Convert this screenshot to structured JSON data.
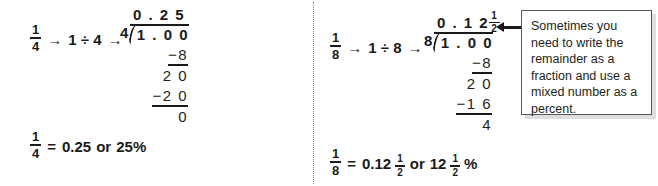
{
  "page": {
    "background": "#ffffff",
    "ink": "#1a1a1a"
  },
  "left_example": {
    "name": "one-fourth-example",
    "lead": {
      "fraction": {
        "numerator": "1",
        "denominator": "4"
      },
      "arrow1": "→",
      "expression": "1 ÷ 4",
      "arrow2": "→"
    },
    "division": {
      "quotient": "0 . 2 5",
      "divisor": "4",
      "dividend": "1 . 0 0",
      "steps": [
        {
          "text": "−8",
          "ruled": true
        },
        {
          "text": "2 0",
          "ruled": false
        },
        {
          "text": "−2 0",
          "ruled": true
        },
        {
          "text": "0",
          "ruled": false
        }
      ]
    },
    "conclusion": {
      "fraction": {
        "numerator": "1",
        "denominator": "4"
      },
      "equals": "=",
      "decimal": "0.25",
      "or": "or",
      "percent": "25%"
    }
  },
  "right_example": {
    "name": "one-eighth-example",
    "lead": {
      "fraction": {
        "numerator": "1",
        "denominator": "8"
      },
      "arrow1": "→",
      "expression": "1 ÷ 8",
      "arrow2": "→"
    },
    "division": {
      "quotient_whole": "0 . 1 2",
      "quotient_fraction": {
        "numerator": "1",
        "denominator": "2"
      },
      "divisor": "8",
      "dividend": "1 . 0 0",
      "steps": [
        {
          "text": "−8",
          "ruled": true
        },
        {
          "text": "2 0",
          "ruled": false
        },
        {
          "text": "−1 6",
          "ruled": true
        },
        {
          "text": "4",
          "ruled": false
        }
      ]
    },
    "conclusion": {
      "fraction": {
        "numerator": "1",
        "denominator": "8"
      },
      "equals": "=",
      "decimal_whole": "0.12",
      "decimal_fraction": {
        "numerator": "1",
        "denominator": "2"
      },
      "or": "or",
      "percent_whole": "12",
      "percent_fraction": {
        "numerator": "1",
        "denominator": "2"
      },
      "percent_sign": "%"
    }
  },
  "callout": {
    "text": "Sometimes you need to write the remainder as a fraction and use a mixed number as a percent.",
    "border_color": "#58585a",
    "background": "#ffffff"
  }
}
